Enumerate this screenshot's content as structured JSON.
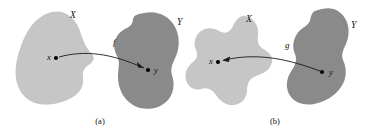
{
  "figure": {
    "background_color": "#ffffff",
    "width": 380,
    "height": 137,
    "domain_blob_color": "#c6c6c6",
    "codomain_blob_color": "#8a8a8a",
    "ink_color": "#1a1a1a"
  },
  "panels": [
    {
      "caption": "(a)",
      "caption_x": 100,
      "caption_y": 124,
      "source_set_label": "X",
      "source_set_label_x": 70,
      "source_set_label_y": 18,
      "target_set_label": "Y",
      "target_set_label_x": 177,
      "target_set_label_y": 25,
      "map_label": "f",
      "map_label_x": 113,
      "map_label_y": 45,
      "source_point_label": "x",
      "source_point_label_x": 47,
      "source_point_label_y": 60,
      "source_point_x": 56,
      "source_point_y": 58,
      "target_point_label": "y",
      "target_point_label_x": 154,
      "target_point_label_y": 73,
      "target_point_x": 148,
      "target_point_y": 70,
      "arrow_direction": "source-to-target",
      "arrow_path": "M 59 57 C 85 50, 110 53, 144 68",
      "arrow_head_points": "144,68 137,62 138,67.5"
    },
    {
      "caption": "(b)",
      "caption_x": 275,
      "caption_y": 124,
      "source_set_label": "X",
      "source_set_label_x": 246,
      "source_set_label_y": 22,
      "target_set_label": "Y",
      "target_set_label_x": 351,
      "target_set_label_y": 28,
      "map_label": "g",
      "map_label_x": 285,
      "map_label_y": 48,
      "source_point_label": "x",
      "source_point_label_x": 209,
      "source_point_label_y": 64,
      "source_point_x": 218,
      "source_point_y": 62,
      "target_point_label": "y",
      "target_point_label_x": 329,
      "target_point_label_y": 75,
      "target_point_x": 322,
      "target_point_y": 72,
      "arrow_direction": "target-to-source",
      "arrow_path": "M 320 71 C 290 60, 260 52, 224 60",
      "arrow_head_points": "222,60.5 230,56.5 229,62"
    }
  ],
  "shapes": {
    "panel_a_source_blob": "M 62 12 C 74 16, 79 26, 82 37 C 85 45, 88 50, 92 54 C 95 57, 94 61, 90 64 C 85 67, 82 71, 83 77 C 84 85, 81 92, 73 97 C 63 103, 50 106, 39 104 C 28 102, 20 94, 17 83 C 14 72, 16 60, 20 49 C 24 37, 29 26, 38 19 C 45 13, 54 10, 62 12 Z",
    "panel_a_target_blob": "M 144 13 C 156 10, 168 15, 174 25 C 180 35, 180 47, 176 56 C 173 63, 170 68, 172 75 C 175 84, 174 95, 166 102 C 157 110, 143 111, 133 105 C 123 99, 118 88, 118 77 C 118 69, 120 63, 118 58 C 115 52, 113 47, 115 41 C 117 34, 122 30, 127 28 C 131 26, 133 23, 133 19 C 134 15, 138 14, 144 13 Z",
    "panel_b_source_blob": "M 246 16 C 256 19, 259 28, 258 36 C 257 43, 259 47, 265 50 C 272 54, 274 61, 270 67 C 267 72, 261 74, 256 76 C 250 78, 247 83, 247 90 C 247 98, 242 104, 234 105 C 226 106, 220 101, 216 95 C 212 89, 207 87, 201 89 C 194 91, 188 87, 186 80 C 184 72, 188 66, 193 62 C 197 59, 198 55, 196 50 C 193 43, 195 35, 201 31 C 207 27, 214 28, 219 31 C 224 34, 229 33, 232 28 C 235 21, 240 14, 246 16 Z",
    "panel_b_target_blob": "M 322 9 C 332 6, 342 11, 346 20 C 350 28, 349 37, 346 44 C 343 50, 341 55, 343 60 C 347 68, 347 79, 341 87 C 335 96, 325 102, 314 104 C 303 106, 293 102, 289 94 C 285 86, 287 77, 292 70 C 296 64, 297 59, 295 54 C 292 47, 293 40, 297 34 C 300 29, 305 27, 308 24 C 311 21, 310 17, 312 14 C 314 10, 318 10, 322 9 Z"
  }
}
